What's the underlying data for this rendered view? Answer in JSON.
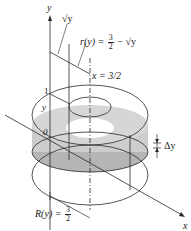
{
  "diagram": {
    "type": "solid-of-revolution-washer",
    "labels": {
      "y_axis": "y",
      "x_axis": "x",
      "sqrt_y": "√y",
      "inner_radius": {
        "prefix": "r(y) =",
        "frac_num": "3",
        "frac_den": "2",
        "suffix": "− √y"
      },
      "x_line": "x = 3/2",
      "one": "1",
      "y_level": "y",
      "origin": "0",
      "delta_y": "Δy",
      "outer_radius": {
        "prefix": "R(y) =",
        "frac_num": "3",
        "frac_den": "2"
      }
    },
    "colors": {
      "line": "#2a2a2a",
      "washer_fill": "#c8c8c8",
      "washer_shadow": "#a9a9a9",
      "hole": "#ffffff"
    }
  }
}
